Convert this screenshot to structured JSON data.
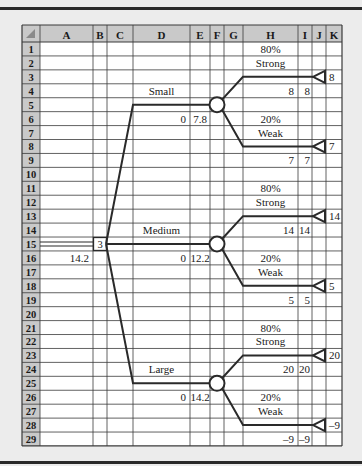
{
  "spreadsheet": {
    "columns": [
      "A",
      "B",
      "C",
      "D",
      "E",
      "F",
      "G",
      "H",
      "I",
      "J",
      "K"
    ],
    "rows": [
      1,
      2,
      3,
      4,
      5,
      6,
      7,
      8,
      9,
      10,
      11,
      12,
      13,
      14,
      15,
      16,
      17,
      18,
      19,
      20,
      21,
      22,
      23,
      24,
      25,
      26,
      27,
      28,
      29
    ],
    "colors": {
      "header_bg": "#c9c9c9",
      "cell_bg": "#ffffff",
      "grid": "#3a3a3a",
      "tree_line": "#2a2a2a",
      "page_bg": "#ececec"
    }
  },
  "decision_tree": {
    "decision_node": {
      "cell": "B15",
      "label": "3",
      "expected_value": "14.2",
      "ev_cell": "A16"
    },
    "branches": [
      {
        "name": "Small",
        "name_cell": "D4",
        "cost": "0",
        "cost_cell": "D6",
        "ev": "7.8",
        "ev_cell": "E6",
        "outcomes": [
          {
            "prob": "80%",
            "prob_cell": "H1",
            "label": "Strong",
            "label_cell": "H2",
            "payoff": "8",
            "payoff_cell": "K3",
            "h_value": "8",
            "i_value": "8",
            "value_row": 4
          },
          {
            "prob": "20%",
            "prob_cell": "H6",
            "label": "Weak",
            "label_cell": "H7",
            "payoff": "7",
            "payoff_cell": "K8",
            "h_value": "7",
            "i_value": "7",
            "value_row": 9
          }
        ]
      },
      {
        "name": "Medium",
        "name_cell": "D14",
        "cost": "0",
        "cost_cell": "D16",
        "ev": "12.2",
        "ev_cell": "E16",
        "outcomes": [
          {
            "prob": "80%",
            "prob_cell": "H11",
            "label": "Strong",
            "label_cell": "H12",
            "payoff": "14",
            "payoff_cell": "K13",
            "h_value": "14",
            "i_value": "14",
            "value_row": 14
          },
          {
            "prob": "20%",
            "prob_cell": "H16",
            "label": "Weak",
            "label_cell": "H17",
            "payoff": "5",
            "payoff_cell": "K18",
            "h_value": "5",
            "i_value": "5",
            "value_row": 19
          }
        ]
      },
      {
        "name": "Large",
        "name_cell": "D24",
        "cost": "0",
        "cost_cell": "D26",
        "ev": "14.2",
        "ev_cell": "E26",
        "outcomes": [
          {
            "prob": "80%",
            "prob_cell": "H21",
            "label": "Strong",
            "label_cell": "H22",
            "payoff": "20",
            "payoff_cell": "K23",
            "h_value": "20",
            "i_value": "20",
            "value_row": 24
          },
          {
            "prob": "20%",
            "prob_cell": "H26",
            "label": "Weak",
            "label_cell": "H27",
            "payoff": "–9",
            "payoff_cell": "K28",
            "h_value": "–9",
            "i_value": "–9",
            "value_row": 29
          }
        ]
      }
    ]
  }
}
